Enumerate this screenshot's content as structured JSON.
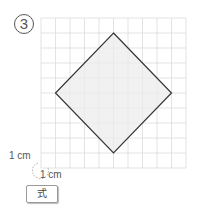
{
  "problem": {
    "number_label": "3",
    "unit_label_vertical": "1 cm",
    "unit_label_horizontal": "1 cm",
    "formula_label": "式"
  },
  "figure": {
    "grid": {
      "columns": 10,
      "rows": 10,
      "x0": 41,
      "y0": 18,
      "cell_w": 14.5,
      "cell_h": 15,
      "line_color": "#dcdcdc"
    },
    "shape": "rhombus",
    "vertices_grid": [
      [
        5,
        1
      ],
      [
        9,
        5
      ],
      [
        5,
        9
      ],
      [
        1,
        5
      ]
    ],
    "fill_color": "#ececec",
    "stroke_color": "#333333"
  }
}
